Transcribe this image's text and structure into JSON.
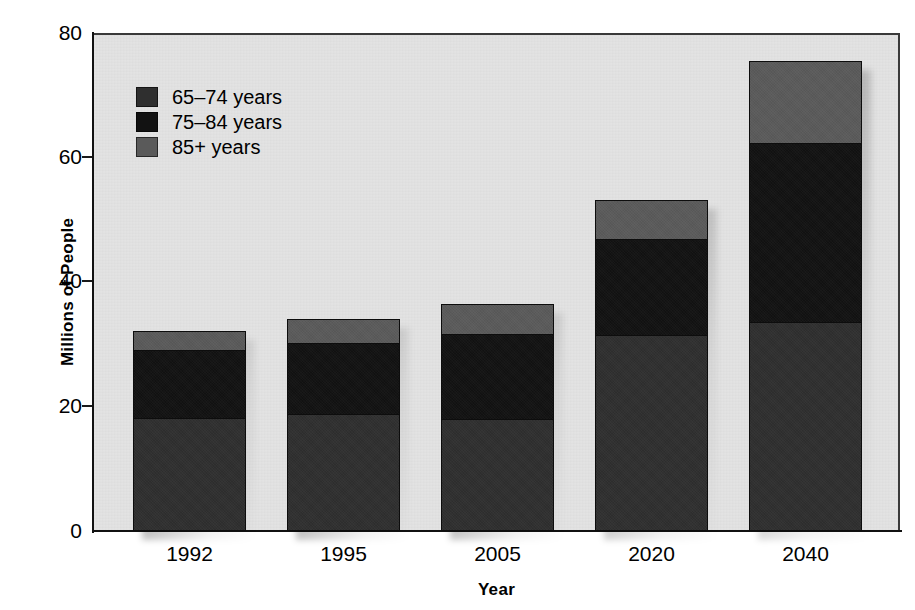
{
  "chart_data": {
    "type": "bar",
    "subtype": "stacked-bar",
    "title": "",
    "xlabel": "Year",
    "ylabel": "Millions of People",
    "categories": [
      "1992",
      "1995",
      "2005",
      "2020",
      "2040"
    ],
    "ytick_labels": [
      "0",
      "20",
      "40",
      "60",
      "80"
    ],
    "ytick_values": [
      0,
      20,
      40,
      60,
      80
    ],
    "ylim": [
      0,
      80
    ],
    "grid": false,
    "legend_position": "upper-left-inside",
    "series": [
      {
        "name": "65–74 years",
        "color": "#2f2f2f",
        "values": [
          18.2,
          18.8,
          18.0,
          31.5,
          33.6
        ]
      },
      {
        "name": "75–84 years",
        "color": "#121212",
        "values": [
          11.0,
          11.6,
          13.8,
          15.6,
          28.9
        ]
      },
      {
        "name": "85+ years",
        "color": "#5a5a5a",
        "values": [
          3.0,
          3.6,
          4.7,
          6.1,
          13.0
        ]
      }
    ],
    "totals": [
      32.2,
      34.0,
      36.5,
      53.2,
      75.5
    ]
  },
  "legend": {
    "items": [
      {
        "label": "65–74 years",
        "color": "#2f2f2f"
      },
      {
        "label": "75–84 years",
        "color": "#121212"
      },
      {
        "label": "85+ years",
        "color": "#5a5a5a"
      }
    ]
  },
  "axes": {
    "y_title": "Millions of People",
    "x_title": "Year"
  },
  "colors": {
    "plot_background": "#e3e3e3",
    "page_background": "#ffffff",
    "axis": "#111111",
    "series_65_74": "#2f2f2f",
    "series_75_84": "#121212",
    "series_85_plus": "#5a5a5a"
  }
}
